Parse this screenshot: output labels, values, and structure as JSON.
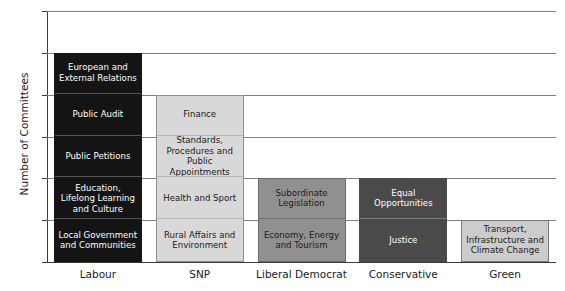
{
  "chart_data": {
    "type": "bar",
    "subtype": "stacked-bar",
    "title": "",
    "xlabel": "",
    "ylabel": "Number of Committees",
    "ylim": [
      0,
      6
    ],
    "yticks": [
      "0",
      "1",
      "2",
      "3",
      "4",
      "5",
      "6"
    ],
    "grid": true,
    "legend": "none",
    "categories": [
      "Labour",
      "SNP",
      "Liberal Democrat",
      "Conservative",
      "Green"
    ],
    "values": [
      5,
      4,
      2,
      2,
      1
    ],
    "colors": {
      "Labour": "#141414",
      "SNP": "#d8d8d8",
      "Liberal Democrat": "#909090",
      "Conservative": "#4a4a4a",
      "Green": "#cccccc",
      "gridline": "#7f7f7f",
      "axis": "#3a3a3a",
      "text_dark": "#1a1a1a",
      "text_light": "#ffffff"
    },
    "bars": [
      {
        "category": "Labour",
        "total": 5,
        "fill": "#141414",
        "stroke": "#141414",
        "text_color": "#ffffff",
        "divider_color": "#555555",
        "segments": [
          {
            "label": "Local Government and Communities",
            "value": 1
          },
          {
            "label": "Education, Lifelong Learning and Culture",
            "value": 1
          },
          {
            "label": "Public Petitions",
            "value": 1
          },
          {
            "label": "Public Audit",
            "value": 1
          },
          {
            "label": "European and External Relations",
            "value": 1
          }
        ]
      },
      {
        "category": "SNP",
        "total": 4,
        "fill": "#d8d8d8",
        "stroke": "#8f8f8f",
        "text_color": "#1a1a1a",
        "divider_color": "#b5b5b5",
        "segments": [
          {
            "label": "Rural Affairs and Environment",
            "value": 1
          },
          {
            "label": "Health and Sport",
            "value": 1
          },
          {
            "label": "Standards, Procedures and Public Appointments",
            "value": 1
          },
          {
            "label": "Finance",
            "value": 1
          }
        ]
      },
      {
        "category": "Liberal Democrat",
        "total": 2,
        "fill": "#909090",
        "stroke": "#6b6b6b",
        "text_color": "#1a1a1a",
        "divider_color": "#6f6f6f",
        "segments": [
          {
            "label": "Economy, Energy and Tourism",
            "value": 1
          },
          {
            "label": "Subordinate Legislation",
            "value": 1
          }
        ]
      },
      {
        "category": "Conservative",
        "total": 2,
        "fill": "#4a4a4a",
        "stroke": "#4a4a4a",
        "text_color": "#ffffff",
        "divider_color": "#7a7a7a",
        "segments": [
          {
            "label": "Justice",
            "value": 1
          },
          {
            "label": "Equal Opportunities",
            "value": 1
          }
        ]
      },
      {
        "category": "Green",
        "total": 1,
        "fill": "#cccccc",
        "stroke": "#7a7a7a",
        "text_color": "#1a1a1a",
        "divider_color": "#a8a8a8",
        "segments": [
          {
            "label": "Transport, Infrastructure and Climate Change",
            "value": 1
          }
        ]
      }
    ]
  }
}
